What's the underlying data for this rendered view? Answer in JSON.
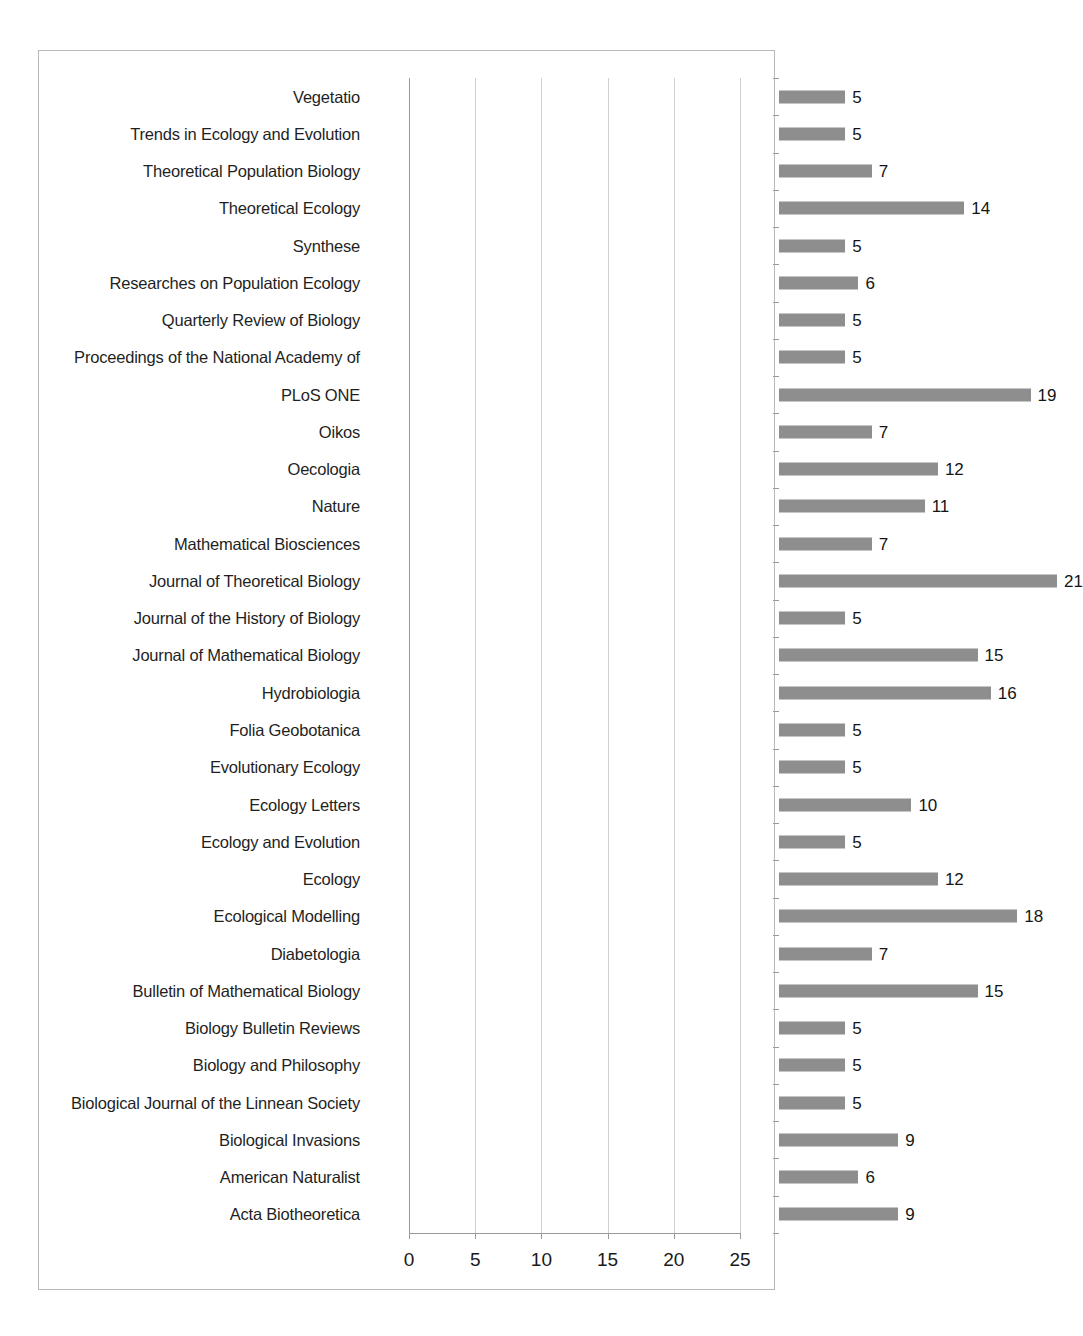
{
  "chart_data": {
    "type": "bar",
    "orientation": "horizontal",
    "title": "",
    "subtitle": "",
    "xlabel": "",
    "ylabel": "",
    "xlim": [
      0,
      25
    ],
    "xticks": [
      0,
      5,
      10,
      15,
      20,
      25
    ],
    "grid": "vertical",
    "legend": "none",
    "bar_color": "#8e8e8e",
    "axis_color": "#9a9a9a",
    "gridline_color": "#d0d0d0",
    "frame_color": "#b9b9b9",
    "data_labels": true,
    "categories": [
      "Vegetatio",
      "Trends in Ecology and Evolution",
      "Theoretical Population Biology",
      "Theoretical Ecology",
      "Synthese",
      "Researches on Population Ecology",
      "Quarterly Review of Biology",
      "Proceedings of the National Academy of",
      "PLoS ONE",
      "Oikos",
      "Oecologia",
      "Nature",
      "Mathematical Biosciences",
      "Journal of Theoretical Biology",
      "Journal of the History of Biology",
      "Journal of Mathematical Biology",
      "Hydrobiologia",
      "Folia Geobotanica",
      "Evolutionary Ecology",
      "Ecology Letters",
      "Ecology and Evolution",
      "Ecology",
      "Ecological Modelling",
      "Diabetologia",
      "Bulletin of Mathematical Biology",
      "Biology Bulletin Reviews",
      "Biology and Philosophy",
      "Biological Journal of the Linnean Society",
      "Biological Invasions",
      "American Naturalist",
      "Acta Biotheoretica"
    ],
    "values": [
      5,
      5,
      7,
      14,
      5,
      6,
      5,
      5,
      19,
      7,
      12,
      11,
      7,
      21,
      5,
      15,
      16,
      5,
      5,
      10,
      5,
      12,
      18,
      7,
      15,
      5,
      5,
      5,
      9,
      6,
      9
    ]
  },
  "axis": {
    "tick_labels": [
      "0",
      "5",
      "10",
      "15",
      "20",
      "25"
    ]
  }
}
